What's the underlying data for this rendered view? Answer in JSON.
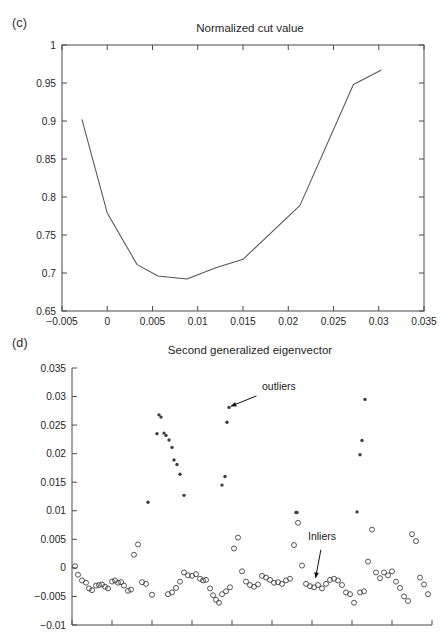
{
  "figure": {
    "panels": [
      {
        "letter": "(c)",
        "title": "Normalized cut value"
      },
      {
        "letter": "(d)",
        "title": "Second generalized eigenvector"
      }
    ]
  },
  "chart_data": [
    {
      "type": "line",
      "panel": "(c)",
      "title": "Normalized cut value",
      "xlabel": "",
      "ylabel": "",
      "xlim": [
        -0.005,
        0.035
      ],
      "ylim": [
        0.65,
        1.0
      ],
      "xticks": [
        -0.005,
        0,
        0.005,
        0.01,
        0.015,
        0.02,
        0.025,
        0.03,
        0.035
      ],
      "xtick_labels": [
        "−0.005",
        "0",
        "0.005",
        "0.01",
        "0.015",
        "0.02",
        "0.025",
        "0.03",
        "0.035"
      ],
      "yticks": [
        0.65,
        0.7,
        0.75,
        0.8,
        0.85,
        0.9,
        0.95,
        1
      ],
      "ytick_labels": [
        "0.65",
        "0.7",
        "0.75",
        "0.8",
        "0.85",
        "0.9",
        "0.95",
        "1"
      ],
      "grid": false,
      "legend": "none",
      "x": [
        -0.0028,
        0.0,
        0.0033,
        0.0056,
        0.0088,
        0.012,
        0.015,
        0.0213,
        0.0272,
        0.0303
      ],
      "y": [
        0.902,
        0.779,
        0.711,
        0.696,
        0.692,
        0.707,
        0.718,
        0.789,
        0.948,
        0.967
      ]
    },
    {
      "type": "scatter",
      "panel": "(d)",
      "title": "Second generalized eigenvector",
      "xlabel": "",
      "ylabel": "",
      "xlim": [
        0,
        360
      ],
      "ylim": [
        -0.01,
        0.035
      ],
      "yticks": [
        -0.01,
        -0.005,
        0,
        0.005,
        0.01,
        0.015,
        0.02,
        0.025,
        0.03,
        0.035
      ],
      "ytick_labels": [
        "−0.01",
        "−0.005",
        "0",
        "0.005",
        "0.01",
        "0.015",
        "0.02",
        "0.025",
        "0.03",
        "0.035"
      ],
      "xticks": [
        0,
        40,
        80,
        120,
        160,
        200,
        240,
        280,
        320,
        360
      ],
      "xtick_labels": [
        "",
        "",
        "",
        "",
        "",
        "",
        "",
        "",
        "",
        ""
      ],
      "grid": false,
      "legend": "none",
      "annotations": [
        {
          "text": "outliers",
          "x": 190,
          "y": 0.0305,
          "arrow_to_x": 156,
          "arrow_to_y": 0.0281
        },
        {
          "text": "Inliers",
          "x": 250,
          "y": 0.0042,
          "arrow_to_x": 243,
          "arrow_to_y": -0.0023
        }
      ],
      "series": [
        {
          "name": "outliers",
          "marker": "filled-dot",
          "x": [
            76,
            85,
            87,
            89,
            92,
            94,
            97,
            100,
            102,
            105,
            108,
            112,
            150,
            153,
            155,
            157,
            224,
            225,
            285,
            288,
            290,
            293,
            378,
            383,
            386
          ],
          "y": [
            0.0115,
            0.0235,
            0.0268,
            0.0264,
            0.0236,
            0.0232,
            0.0224,
            0.0211,
            0.0189,
            0.0181,
            0.0164,
            0.0127,
            0.0145,
            0.016,
            0.0255,
            0.0281,
            0.0097,
            0.0097,
            0.0098,
            0.0198,
            0.0223,
            0.0295,
            0.012,
            0.0151,
            0.0173
          ]
        },
        {
          "name": "inliers",
          "marker": "open-circle",
          "x": [
            3,
            6,
            10,
            14,
            17,
            20,
            24,
            27,
            30,
            33,
            36,
            40,
            43,
            46,
            49,
            52,
            56,
            59,
            62,
            66,
            70,
            74,
            80,
            96,
            100,
            104,
            108,
            112,
            116,
            120,
            124,
            128,
            131,
            134,
            138,
            141,
            144,
            147,
            150,
            154,
            158,
            162,
            166,
            170,
            174,
            178,
            182,
            186,
            190,
            194,
            198,
            202,
            206,
            210,
            214,
            218,
            222,
            226,
            230,
            234,
            238,
            242,
            246,
            250,
            254,
            258,
            262,
            266,
            270,
            274,
            278,
            282,
            288,
            292,
            296,
            300,
            304,
            308,
            312,
            316,
            320,
            324,
            328,
            332,
            336,
            340,
            344,
            348,
            352,
            356
          ],
          "y": [
            0.0003,
            -0.0012,
            -0.0022,
            -0.0026,
            -0.0036,
            -0.0039,
            -0.0031,
            -0.003,
            -0.0029,
            -0.0033,
            -0.0036,
            -0.0024,
            -0.0022,
            -0.0026,
            -0.0025,
            -0.0031,
            -0.004,
            -0.0038,
            0.0023,
            0.0041,
            -0.0025,
            -0.0028,
            -0.0047,
            -0.0046,
            -0.0043,
            -0.0035,
            -0.0024,
            -0.0008,
            -0.0013,
            -0.0014,
            -0.0011,
            -0.0019,
            -0.0022,
            -0.0021,
            -0.0036,
            -0.0048,
            -0.0056,
            -0.0061,
            -0.0046,
            -0.0041,
            -0.0034,
            0.0034,
            0.0053,
            -0.0006,
            -0.0024,
            -0.003,
            -0.0033,
            -0.0029,
            -0.0014,
            -0.0017,
            -0.0021,
            -0.0026,
            -0.0025,
            -0.0028,
            -0.0022,
            -0.0019,
            0.004,
            0.0079,
            0.0004,
            -0.0028,
            -0.0032,
            -0.0034,
            -0.003,
            -0.0036,
            -0.0028,
            -0.0021,
            -0.0019,
            -0.0022,
            -0.003,
            -0.0043,
            -0.0046,
            -0.0061,
            -0.0043,
            -0.0041,
            0.0011,
            0.0067,
            -0.0008,
            -0.0018,
            -0.0008,
            -0.0013,
            -0.0006,
            -0.0024,
            -0.0035,
            -0.005,
            -0.0058,
            0.0059,
            0.0047,
            -0.0017,
            -0.0029,
            -0.0046
          ]
        }
      ]
    }
  ]
}
